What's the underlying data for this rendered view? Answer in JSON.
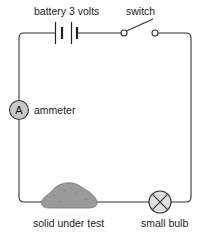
{
  "diagram": {
    "labels": {
      "battery": "battery 3 volts",
      "switch": "switch",
      "ammeter": "ammeter",
      "ammeter_symbol": "A",
      "solid": "solid under test",
      "bulb": "small bulb"
    },
    "components": [
      {
        "id": "battery",
        "type": "battery",
        "voltage": "3 volts",
        "cells": 2
      },
      {
        "id": "switch",
        "type": "switch",
        "state": "open"
      },
      {
        "id": "ammeter",
        "type": "ammeter",
        "symbol": "A"
      },
      {
        "id": "solid",
        "type": "sample",
        "description": "solid under test"
      },
      {
        "id": "bulb",
        "type": "lamp",
        "description": "small bulb"
      }
    ],
    "colors": {
      "wire": "#333333",
      "ammeter_fill": "#c8c8c8",
      "bulb_fill": "#e0e0e0",
      "solid_fill": "#9a9a9a"
    }
  }
}
